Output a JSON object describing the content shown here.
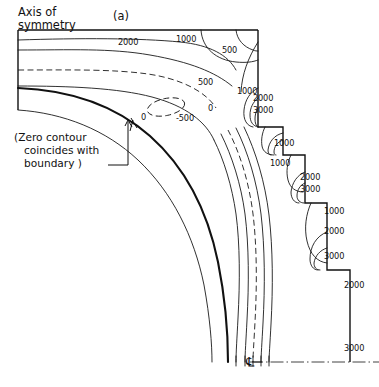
{
  "figure": {
    "panel_label": "(a)",
    "axis_label_line1": "Axis of",
    "axis_label_line2": "symmetry",
    "note_line1": "(Zero contour",
    "note_line2": "coincides with",
    "note_line3": "boundary )",
    "centerline_symbol": "℄",
    "ink_color": "#111111",
    "background_color": "#ffffff"
  },
  "chart_data": {
    "type": "line",
    "title": "(a)",
    "subtitle": "Contour plot of stress field in axisymmetric vessel corner",
    "xlabel": "",
    "ylabel": "",
    "grid": false,
    "legend": "none",
    "contour_levels": [
      -500,
      0,
      500,
      1000,
      2000,
      3000
    ],
    "contour_label_texts": [
      "2000",
      "1000",
      "500",
      "500",
      "1000",
      "0",
      "-500",
      "0",
      "1000",
      "2000",
      "3000",
      "1000",
      "1000",
      "2000",
      "3000",
      "1000",
      "2000",
      "3000",
      "2000",
      "3000"
    ],
    "annotations": [
      "Axis of symmetry",
      "(Zero contour coincides with boundary )",
      "℄"
    ]
  },
  "labels": [
    {
      "id": "l01",
      "text": "2000",
      "x": 118,
      "y": 45
    },
    {
      "id": "l02",
      "text": "1000",
      "x": 176,
      "y": 42
    },
    {
      "id": "l03",
      "text": "500",
      "x": 222,
      "y": 53
    },
    {
      "id": "l04",
      "text": "500",
      "x": 198,
      "y": 85
    },
    {
      "id": "l05",
      "text": "1000",
      "x": 237,
      "y": 94
    },
    {
      "id": "l06",
      "text": "0",
      "x": 208,
      "y": 111
    },
    {
      "id": "l07",
      "text": "-500",
      "x": 176,
      "y": 121
    },
    {
      "id": "l08",
      "text": "0",
      "x": 141,
      "y": 120
    },
    {
      "id": "l09",
      "text": "2000",
      "x": 253,
      "y": 101
    },
    {
      "id": "l10",
      "text": "3000",
      "x": 253,
      "y": 113
    },
    {
      "id": "l11",
      "text": "1000",
      "x": 274,
      "y": 146
    },
    {
      "id": "l12",
      "text": "1000",
      "x": 270,
      "y": 166
    },
    {
      "id": "l13",
      "text": "2000",
      "x": 300,
      "y": 180
    },
    {
      "id": "l14",
      "text": "3000",
      "x": 300,
      "y": 192
    },
    {
      "id": "l15",
      "text": "1000",
      "x": 324,
      "y": 214
    },
    {
      "id": "l16",
      "text": "2000",
      "x": 324,
      "y": 234
    },
    {
      "id": "l17",
      "text": "3000",
      "x": 324,
      "y": 259
    },
    {
      "id": "l18",
      "text": "2000",
      "x": 344,
      "y": 288
    },
    {
      "id": "l19",
      "text": "3000",
      "x": 344,
      "y": 351
    }
  ]
}
